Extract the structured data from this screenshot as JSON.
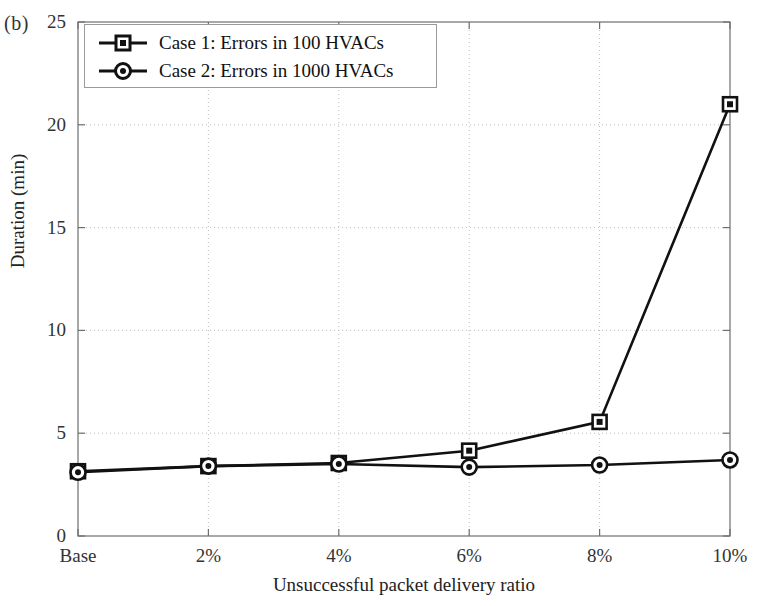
{
  "figure": {
    "panel_label": "(b)",
    "background_color": "#ffffff",
    "axis_color": "#6e6e6e",
    "grid_color": "#bdbdbd",
    "series_color": "#111111"
  },
  "chart_data": {
    "type": "line",
    "title": "",
    "subtitle": "",
    "xlabel": "Unsuccessful packet delivery ratio",
    "ylabel": "Duration (min)",
    "categories": [
      "Base",
      "2%",
      "4%",
      "6%",
      "8%",
      "10%"
    ],
    "x_tick_labels": [
      "Base",
      "2%",
      "4%",
      "6%",
      "8%",
      "10%"
    ],
    "y_tick_labels": [
      "0",
      "5",
      "10",
      "15",
      "20",
      "25"
    ],
    "y_ticks": [
      0,
      5,
      10,
      15,
      20,
      25
    ],
    "ylim": [
      0,
      25
    ],
    "xlim": [
      0,
      5
    ],
    "grid": true,
    "grid_style": "dotted",
    "legend_position": "top-left",
    "series": [
      {
        "name": "Case 1: Errors in 100 HVACs",
        "marker": "square",
        "color": "#111111",
        "values": [
          3.15,
          3.4,
          3.55,
          4.15,
          5.55,
          21.0
        ]
      },
      {
        "name": "Case 2: Errors in 1000 HVACs",
        "marker": "circle",
        "color": "#111111",
        "values": [
          3.1,
          3.4,
          3.5,
          3.35,
          3.45,
          3.7
        ]
      }
    ],
    "legend": [
      "Case 1: Errors in 100 HVACs",
      "Case 2: Errors in 1000 HVACs"
    ]
  }
}
